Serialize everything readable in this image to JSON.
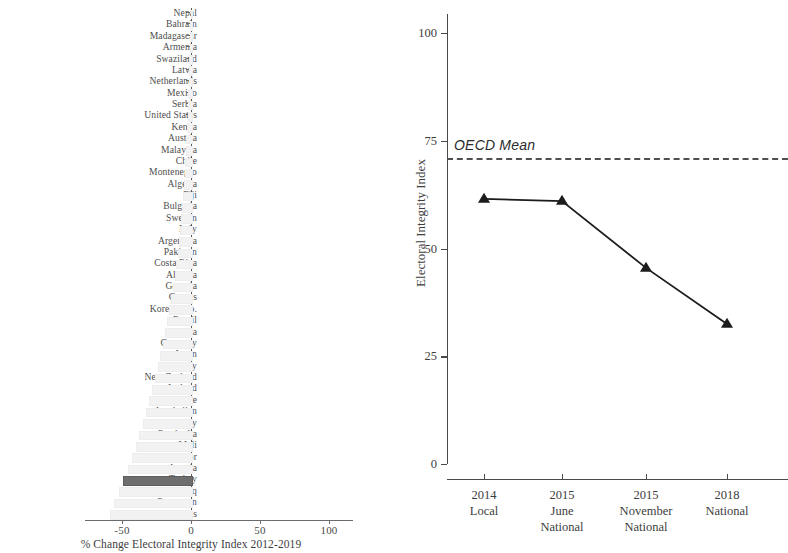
{
  "chart_data": [
    {
      "id": "left",
      "type": "bar",
      "orientation": "horizontal",
      "title": "",
      "xlabel": "% Change Electoral Integrity Index 2012-2019",
      "ylabel": "",
      "xlim": [
        -62,
        100
      ],
      "xticks": [
        -50,
        0,
        50,
        100
      ],
      "xticklabels": [
        "-50",
        "0",
        "50",
        "100"
      ],
      "grid": false,
      "legend": false,
      "bar_color": "#f2f2f2",
      "highlight_color": "#6e6e6e",
      "highlight_category": "Turkey",
      "categories": [
        "Nepal",
        "Bahrain",
        "Madagascar",
        "Armenia",
        "Swaziland",
        "Latvia",
        "Netherlands",
        "Mexico",
        "Serbia",
        "United States",
        "Kenya",
        "Austria",
        "Malaysia",
        "Chile",
        "Montenegro",
        "Algeria",
        "Fiji",
        "Bulgaria",
        "Sweden",
        "Italy",
        "Argentina",
        "Pakistan",
        "Costa Rica",
        "Albania",
        "Georgia",
        "Cyprus",
        "Korea, Rep.",
        "Brazil",
        "Malta",
        "Germany",
        "Japan",
        "Hungary",
        "New Zealand",
        "Iceland",
        "Zimbabwe",
        "Azerbaijan",
        "Paraguay",
        "Cambodia",
        "Mali",
        "Ecuador",
        "Angola",
        "Turkey",
        "Iraq",
        "Cameroon",
        "Honduras"
      ],
      "values": [
        -0.3,
        -0.5,
        -0.7,
        -0.9,
        -1.1,
        -1.3,
        -1.6,
        -1.9,
        -2.2,
        -2.5,
        -2.9,
        -3.3,
        -3.7,
        -4.1,
        -4.6,
        -5.1,
        -5.7,
        -6.3,
        -7.0,
        -7.8,
        -8.7,
        -9.6,
        -10.6,
        -11.7,
        -12.9,
        -14.2,
        -15.6,
        -17.1,
        -18.7,
        -20.4,
        -22.2,
        -24.1,
        -26.1,
        -28.2,
        -30.4,
        -32.7,
        -35.1,
        -37.6,
        -40.2,
        -42.9,
        -45.7,
        -49.6,
        -52.0,
        -55.5,
        -58.5
      ]
    },
    {
      "id": "right",
      "type": "line",
      "title": "",
      "xlabel": "",
      "ylabel": "Electoral Integrity Index",
      "ylim": [
        0,
        108
      ],
      "yticks": [
        0,
        25,
        50,
        75,
        100
      ],
      "yticklabels": [
        "0",
        "25",
        "50",
        "75",
        "100"
      ],
      "grid": false,
      "legend": false,
      "marker": "triangle",
      "line_color": "#1c1c1c",
      "categories": [
        "2014 Local",
        "2015 June National",
        "2015 November National",
        "2018 National"
      ],
      "xticklabels": [
        {
          "line1": "2014",
          "line2": "Local",
          "line3": ""
        },
        {
          "line1": "2015",
          "line2": "June",
          "line3": "National"
        },
        {
          "line1": "2015",
          "line2": "November",
          "line3": "National"
        },
        {
          "line1": "2018",
          "line2": "National",
          "line3": ""
        }
      ],
      "values": [
        61.5,
        61.0,
        45.5,
        32.5
      ],
      "annotations": [
        {
          "name": "oecd-mean",
          "label": "OECD Mean",
          "value": 71,
          "style": "dashed-horizontal-line"
        }
      ]
    }
  ],
  "left": {
    "axis_title": "% Change Electoral Integrity Index 2012-2019"
  },
  "right": {
    "y_axis_title": "Electoral Integrity Index",
    "oecd_label": "OECD Mean"
  }
}
